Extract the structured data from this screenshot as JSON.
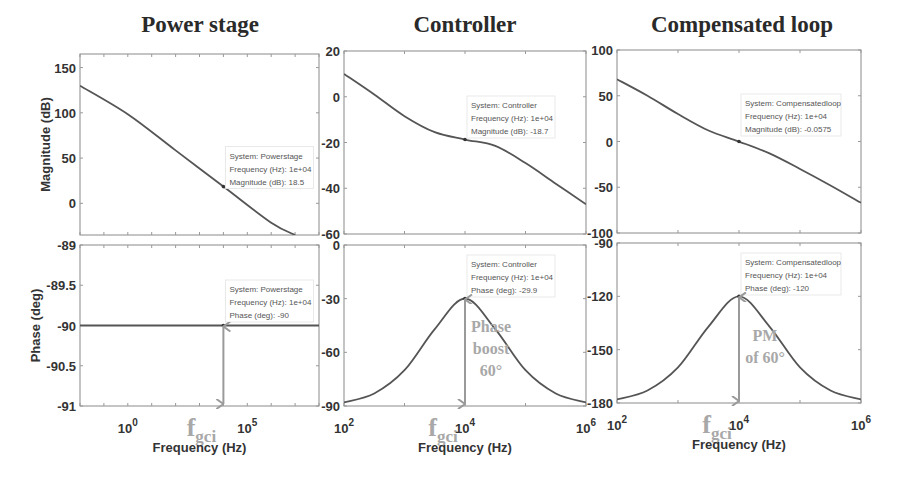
{
  "figure": {
    "xlabel": "Frequency  (Hz)",
    "ylabel_mag": "Magnitude (dB)",
    "ylabel_phase": "Phase (deg)",
    "colors": {
      "curve": "#555555",
      "arrow": "#9a9a9a",
      "annotation": "#a8a8a8",
      "axis": "#666666"
    }
  },
  "chart_data": [
    {
      "type": "line",
      "panel": "power-stage",
      "title": "Power stage",
      "xscale": "log",
      "xlim": [
        0.01,
        100000000.0
      ],
      "xticks": [
        {
          "v": 1,
          "label": "10",
          "exp": "0"
        },
        {
          "v": 100000,
          "label": "10",
          "exp": "5"
        }
      ],
      "magnitude": {
        "ylabel": "Magnitude (dB)",
        "ylim": [
          -35,
          165
        ],
        "yticks": [
          150,
          100,
          50,
          0
        ],
        "x": [
          0.01,
          1,
          100,
          10000,
          1000000,
          10000000
        ],
        "y": [
          130,
          98.5,
          58.5,
          18.5,
          -21.5,
          -35
        ],
        "datatip": {
          "lines": [
            "System: Powerstage",
            "Frequency (Hz): 1e+04",
            "Magnitude (dB): 18.5"
          ],
          "x": 10000,
          "y": 18.5
        }
      },
      "phase": {
        "ylabel": "Phase (deg)",
        "ylim": [
          -91,
          -89
        ],
        "yticks": [
          -89,
          -89.5,
          -90,
          -90.5,
          -91
        ],
        "x": [
          0.01,
          100000000.0
        ],
        "y": [
          -90,
          -90
        ],
        "datatip": {
          "lines": [
            "System: Powerstage",
            "Frequency (Hz): 1e+04",
            "Phase (deg): -90"
          ],
          "x": 10000,
          "y": -90
        }
      },
      "annotation": {
        "fgci": "f",
        "fgci_sub": "gci",
        "arrow_from": -90,
        "arrow_to": -91
      }
    },
    {
      "type": "line",
      "panel": "controller",
      "title": "Controller",
      "xscale": "log",
      "xlim": [
        100,
        1000000
      ],
      "xticks": [
        {
          "v": 100,
          "label": "10",
          "exp": "2"
        },
        {
          "v": 10000,
          "label": "10",
          "exp": "4"
        },
        {
          "v": 1000000,
          "label": "10",
          "exp": "6"
        }
      ],
      "magnitude": {
        "ylabel": "",
        "ylim": [
          -60,
          20
        ],
        "yticks": [
          20,
          0,
          -20,
          -40,
          -60
        ],
        "x": [
          100,
          316,
          1000,
          3162,
          10000,
          31623,
          100000,
          316228,
          1000000
        ],
        "y": [
          10,
          1,
          -8.5,
          -15.5,
          -18.7,
          -21.5,
          -29,
          -38,
          -47
        ],
        "datatip": {
          "lines": [
            "System: Controller",
            "Frequency (Hz): 1e+04",
            "Magnitude (dB): -18.7"
          ],
          "x": 10000,
          "y": -18.7
        }
      },
      "phase": {
        "ylabel": "",
        "ylim": [
          -90,
          0
        ],
        "yticks": [
          0,
          -30,
          -60,
          -90
        ],
        "x": [
          100,
          316,
          1000,
          3162,
          10000,
          31623,
          100000,
          316228,
          1000000
        ],
        "y": [
          -88,
          -83,
          -70,
          -47,
          -29.9,
          -47,
          -70,
          -83,
          -88
        ],
        "datatip": {
          "lines": [
            "System: Controller",
            "Frequency (Hz): 1e+04",
            "Phase (deg): -29.9"
          ],
          "x": 10000,
          "y": -29.9
        }
      },
      "annotation": {
        "fgci": "f",
        "fgci_sub": "gci",
        "text": [
          "Phase",
          "boost",
          "60°"
        ],
        "arrow_from": -29.9,
        "arrow_to": -90
      }
    },
    {
      "type": "line",
      "panel": "compensated-loop",
      "title": "Compensated loop",
      "xscale": "log",
      "xlim": [
        100,
        1000000
      ],
      "xticks": [
        {
          "v": 100,
          "label": "10",
          "exp": "2"
        },
        {
          "v": 10000,
          "label": "10",
          "exp": "4"
        },
        {
          "v": 1000000,
          "label": "10",
          "exp": "6"
        }
      ],
      "magnitude": {
        "ylabel": "",
        "ylim": [
          -100,
          100
        ],
        "yticks": [
          100,
          50,
          0,
          -50,
          -100
        ],
        "x": [
          100,
          316,
          1000,
          3162,
          10000,
          31623,
          100000,
          316228,
          1000000
        ],
        "y": [
          68,
          50,
          30,
          12,
          -0.0575,
          -13,
          -30,
          -48,
          -67
        ],
        "datatip": {
          "lines": [
            "System: Compensatedloop",
            "Frequency (Hz): 1e+04",
            "Magnitude (dB): -0.0575"
          ],
          "x": 10000,
          "y": -0.0575
        }
      },
      "phase": {
        "ylabel": "",
        "ylim": [
          -180,
          -90
        ],
        "yticks": [
          -90,
          -120,
          -150,
          -180
        ],
        "x": [
          100,
          316,
          1000,
          3162,
          10000,
          31623,
          100000,
          316228,
          1000000
        ],
        "y": [
          -178,
          -173,
          -160,
          -137,
          -120,
          -137,
          -160,
          -173,
          -178
        ],
        "datatip": {
          "lines": [
            "System: Compensatedloop",
            "Frequency (Hz): 1e+04",
            "Phase (deg): -120"
          ],
          "x": 10000,
          "y": -120
        }
      },
      "annotation": {
        "fgci": "f",
        "fgci_sub": "gci",
        "text": [
          "PM",
          "of 60°"
        ],
        "arrow_from": -120,
        "arrow_to": -180
      }
    }
  ]
}
